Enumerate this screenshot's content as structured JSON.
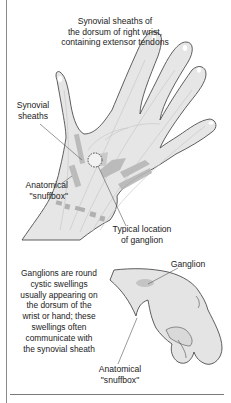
{
  "figure": {
    "title_lines": [
      "Synovial sheaths of",
      "the dorsum of right wrist,",
      "containing extensor tendons"
    ],
    "top_illustration": {
      "subject": "dorsal view of right hand and wrist",
      "labels": {
        "synovial_sheaths": [
          "Synovial",
          "sheaths"
        ],
        "anatomical_snuffbox": [
          "Anatomical",
          "\"snuffbox\""
        ],
        "typical_location": [
          "Typical location",
          "of ganglion"
        ]
      },
      "marker": "dashed circle indicating ganglion site"
    },
    "bottom_illustration": {
      "subject": "lateral view of wrist with ganglion swelling",
      "labels": {
        "ganglion": "Ganglion",
        "anatomical_snuffbox": [
          "Anatomical",
          "\"snuffbox\""
        ]
      }
    },
    "description_lines": [
      "Ganglions are round",
      "cystic swellings",
      "usually appearing on",
      "the dorsum of the",
      "wrist or hand; these",
      "swellings often",
      "communicate with",
      "the synovial sheath"
    ]
  },
  "colors": {
    "skin_fill": "#e4e4e4",
    "outline": "#555555",
    "sheath": "#b5b5b5",
    "sheath_dark": "#a0a0a0",
    "ganglion": "#c8c8c8",
    "frame": "#8a8a8a"
  }
}
